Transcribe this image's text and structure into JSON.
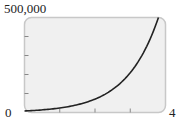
{
  "chart_data": {
    "type": "line",
    "title": "",
    "xlabel": "",
    "ylabel": "",
    "xlim": [
      0,
      4
    ],
    "ylim": [
      0,
      500000
    ],
    "x_tick_labels": [
      "0",
      "4"
    ],
    "y_tick_labels": [
      "500,000"
    ],
    "x_ticks": [
      1,
      2,
      3
    ],
    "y_ticks": [
      100000,
      200000,
      300000,
      400000
    ],
    "grid": false,
    "series": [
      {
        "name": "curve",
        "x": [
          0,
          0.5,
          1,
          1.5,
          2,
          2.5,
          3,
          3.5,
          3.8
        ],
        "values": [
          8000,
          14000,
          24000,
          42000,
          72000,
          125000,
          215000,
          375000,
          500000
        ]
      }
    ]
  },
  "labels": {
    "y_max": "500,000",
    "x_min": "0",
    "x_max": "4"
  },
  "colors": {
    "plot_bg": "#f0f0f0",
    "frame": "#c8c8c8",
    "curve": "#222222"
  }
}
